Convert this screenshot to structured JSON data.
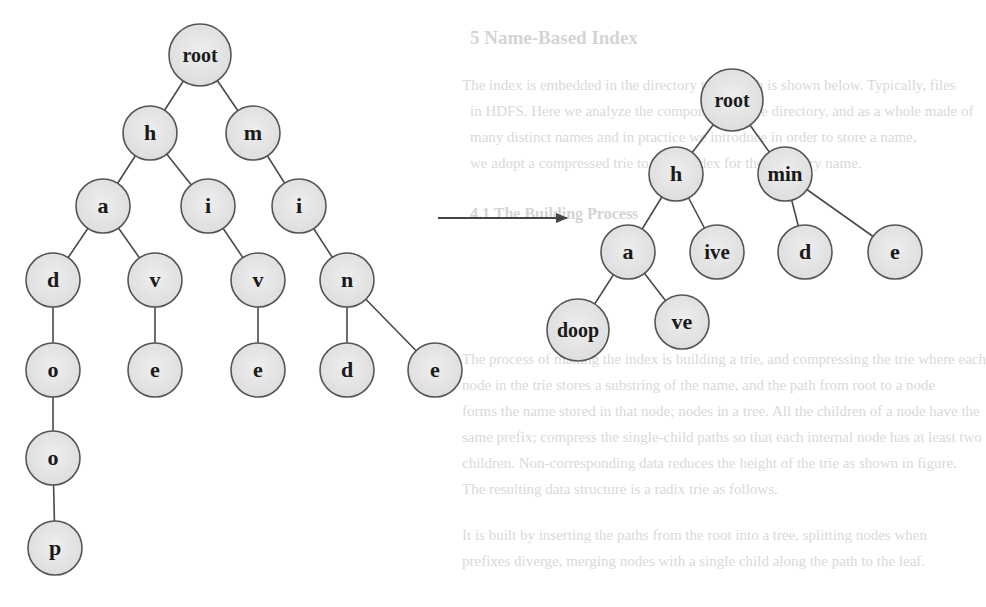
{
  "colors": {
    "background": "#ffffff",
    "node_fill": "#e6e6e6",
    "node_stroke": "#555555",
    "edge": "#4a4a4a",
    "label": "#1a1a1a",
    "arrow": "#444444",
    "bleed_text": "#d9d9d9"
  },
  "node_radius": 27,
  "left_trie": {
    "title": "trie before compression",
    "nodes": [
      {
        "id": "L_root",
        "label": "root",
        "x": 200,
        "y": 55
      },
      {
        "id": "L_h",
        "label": "h",
        "x": 150,
        "y": 133
      },
      {
        "id": "L_m",
        "label": "m",
        "x": 253,
        "y": 133
      },
      {
        "id": "L_a",
        "label": "a",
        "x": 103,
        "y": 206
      },
      {
        "id": "L_i1",
        "label": "i",
        "x": 208,
        "y": 206
      },
      {
        "id": "L_i2",
        "label": "i",
        "x": 299,
        "y": 206
      },
      {
        "id": "L_d1",
        "label": "d",
        "x": 53,
        "y": 280
      },
      {
        "id": "L_v1",
        "label": "v",
        "x": 155,
        "y": 280
      },
      {
        "id": "L_v2",
        "label": "v",
        "x": 258,
        "y": 280
      },
      {
        "id": "L_n",
        "label": "n",
        "x": 347,
        "y": 280
      },
      {
        "id": "L_o1",
        "label": "o",
        "x": 53,
        "y": 370
      },
      {
        "id": "L_e1",
        "label": "e",
        "x": 155,
        "y": 370
      },
      {
        "id": "L_e2",
        "label": "e",
        "x": 258,
        "y": 370
      },
      {
        "id": "L_d2",
        "label": "d",
        "x": 347,
        "y": 370
      },
      {
        "id": "L_e3",
        "label": "e",
        "x": 435,
        "y": 370
      },
      {
        "id": "L_o2",
        "label": "o",
        "x": 53,
        "y": 458
      },
      {
        "id": "L_p",
        "label": "p",
        "x": 55,
        "y": 548
      }
    ],
    "edges": [
      [
        "L_root",
        "L_h"
      ],
      [
        "L_root",
        "L_m"
      ],
      [
        "L_h",
        "L_a"
      ],
      [
        "L_h",
        "L_i1"
      ],
      [
        "L_m",
        "L_i2"
      ],
      [
        "L_a",
        "L_d1"
      ],
      [
        "L_a",
        "L_v1"
      ],
      [
        "L_i1",
        "L_v2"
      ],
      [
        "L_i2",
        "L_n"
      ],
      [
        "L_d1",
        "L_o1"
      ],
      [
        "L_v1",
        "L_e1"
      ],
      [
        "L_v2",
        "L_e2"
      ],
      [
        "L_n",
        "L_d2"
      ],
      [
        "L_n",
        "L_e3"
      ],
      [
        "L_o1",
        "L_o2"
      ],
      [
        "L_o2",
        "L_p"
      ]
    ]
  },
  "arrow": {
    "x1": 438,
    "y1": 218,
    "x2": 567,
    "y2": 218
  },
  "right_trie": {
    "title": "compressed (radix) trie",
    "nodes": [
      {
        "id": "R_root",
        "label": "root",
        "x": 732,
        "y": 100
      },
      {
        "id": "R_h",
        "label": "h",
        "x": 676,
        "y": 174
      },
      {
        "id": "R_min",
        "label": "min",
        "x": 785,
        "y": 174
      },
      {
        "id": "R_a",
        "label": "a",
        "x": 628,
        "y": 252
      },
      {
        "id": "R_ive",
        "label": "ive",
        "x": 717,
        "y": 252
      },
      {
        "id": "R_d",
        "label": "d",
        "x": 805,
        "y": 252
      },
      {
        "id": "R_e",
        "label": "e",
        "x": 895,
        "y": 252
      },
      {
        "id": "R_doop",
        "label": "doop",
        "x": 578,
        "y": 330
      },
      {
        "id": "R_ve",
        "label": "ve",
        "x": 682,
        "y": 322
      }
    ],
    "edges": [
      [
        "R_root",
        "R_h"
      ],
      [
        "R_root",
        "R_min"
      ],
      [
        "R_h",
        "R_a"
      ],
      [
        "R_h",
        "R_ive"
      ],
      [
        "R_min",
        "R_d"
      ],
      [
        "R_min",
        "R_e"
      ],
      [
        "R_a",
        "R_doop"
      ],
      [
        "R_a",
        "R_ve"
      ]
    ]
  },
  "bleed_through_text": {
    "heading": "5   Name-Based Index",
    "lines": [
      "The index is embedded in the directory tree which is shown below. Typically, files",
      "in HDFS. Here we analyze the components of the directory, and as a whole made of",
      "many distinct names and in practice we introduce in order to store a name,",
      "we adopt a compressed trie to build index for the directory name.",
      "4.1   The Building Process",
      "The process of making the index is building a trie, and compressing the trie where each",
      "node in the trie stores a substring of the name, and the path from root to a node",
      "forms the name stored in that node; nodes in a tree. All the children of a node have the",
      "same prefix; compress the single-child paths so that each internal node has at least two",
      "children. Non-corresponding data reduces the height of the trie as shown in figure.",
      "The resulting data structure is a radix trie as follows.",
      "It is built by inserting the paths from the root into a tree, splitting nodes when",
      "prefixes diverge, merging nodes with a single child along the path to the leaf."
    ]
  }
}
